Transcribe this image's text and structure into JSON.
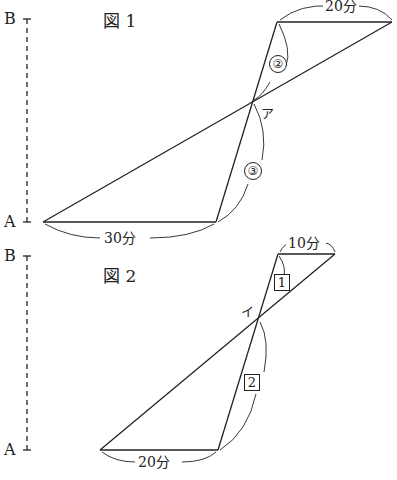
{
  "figure1": {
    "title": "図 1",
    "axis_top_label": "B",
    "axis_bottom_label": "A",
    "crossing_label": "ア",
    "ratio_upper": "②",
    "ratio_lower": "③",
    "top_duration": "20分",
    "bottom_duration": "30分"
  },
  "figure2": {
    "title": "図 2",
    "axis_top_label": "B",
    "axis_bottom_label": "A",
    "crossing_label": "イ",
    "ratio_upper": "1",
    "ratio_lower": "2",
    "top_duration": "10分",
    "bottom_duration": "20分"
  }
}
